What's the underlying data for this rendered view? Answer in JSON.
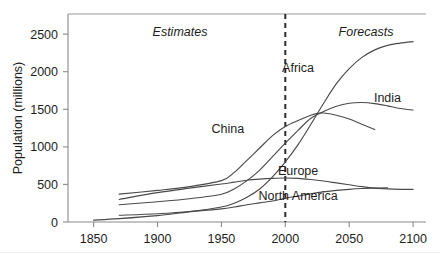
{
  "chart_data": {
    "type": "line",
    "title": "",
    "xlabel": "",
    "ylabel": "Population (millions)",
    "xlim": [
      1830,
      2110
    ],
    "ylim": [
      0,
      2700
    ],
    "grid": false,
    "legend_position": "inline-labels",
    "x_ticks": [
      "1850",
      "1900",
      "1950",
      "2000",
      "2050",
      "2100"
    ],
    "x_tick_values": [
      1850,
      1900,
      1950,
      2000,
      2050,
      2100
    ],
    "y_ticks": [
      "0",
      "500",
      "1000",
      "1500",
      "2000",
      "2500"
    ],
    "y_tick_values": [
      0,
      500,
      1000,
      1500,
      2000,
      2500
    ],
    "annotations": [
      {
        "text": "Estimates",
        "x": 1910,
        "y": 2620,
        "style": "italic"
      },
      {
        "text": "Forecasts",
        "x": 2055,
        "y": 2620,
        "style": "italic"
      },
      {
        "text": "divider",
        "x": 2000,
        "y": 0,
        "style": "dashed-vertical"
      }
    ],
    "series": [
      {
        "name": "Africa",
        "label": "Africa",
        "label_x": 2010,
        "label_y": 2000,
        "x": [
          1870,
          1900,
          1925,
          1950,
          1960,
          1970,
          1980,
          1990,
          2000,
          2010,
          2020,
          2030,
          2040,
          2050,
          2060,
          2070,
          2080,
          2090,
          2100
        ],
        "y": [
          90,
          110,
          140,
          200,
          250,
          330,
          440,
          600,
          800,
          1030,
          1300,
          1580,
          1840,
          2040,
          2190,
          2290,
          2350,
          2380,
          2400
        ]
      },
      {
        "name": "India",
        "label": "India",
        "label_x": 2080,
        "label_y": 1600,
        "x": [
          1870,
          1900,
          1925,
          1950,
          1960,
          1970,
          1980,
          1990,
          2000,
          2010,
          2020,
          2030,
          2040,
          2050,
          2060,
          2070,
          2080,
          2090,
          2100
        ],
        "y": [
          230,
          270,
          310,
          370,
          440,
          550,
          690,
          870,
          1050,
          1220,
          1380,
          1470,
          1540,
          1580,
          1590,
          1575,
          1545,
          1510,
          1490
        ]
      },
      {
        "name": "China",
        "label": "China",
        "label_x": 1955,
        "label_y": 1180,
        "x": [
          1870,
          1900,
          1925,
          1950,
          1960,
          1970,
          1980,
          1990,
          2000,
          2010,
          2020,
          2025,
          2030,
          2040,
          2050,
          2060,
          2070
        ],
        "y": [
          370,
          420,
          470,
          550,
          660,
          820,
          985,
          1150,
          1270,
          1350,
          1420,
          1445,
          1450,
          1420,
          1370,
          1300,
          1230
        ]
      },
      {
        "name": "Europe",
        "label": "Europe",
        "label_x": 2010,
        "label_y": 620,
        "x": [
          1870,
          1900,
          1925,
          1950,
          1960,
          1970,
          1980,
          1990,
          2000,
          2010,
          2020,
          2030,
          2040,
          2050,
          2060,
          2070,
          2080,
          2090,
          2100
        ],
        "y": [
          300,
          390,
          450,
          505,
          530,
          555,
          570,
          580,
          585,
          580,
          565,
          545,
          520,
          495,
          470,
          450,
          440,
          435,
          435
        ]
      },
      {
        "name": "North America",
        "label": "North America",
        "label_x": 2010,
        "label_y": 290,
        "x": [
          1850,
          1870,
          1900,
          1925,
          1950,
          1960,
          1970,
          1980,
          1990,
          2000,
          2010,
          2020,
          2030,
          2040,
          2050,
          2060,
          2070,
          2080
        ],
        "y": [
          25,
          45,
          85,
          135,
          175,
          200,
          230,
          255,
          280,
          315,
          345,
          375,
          400,
          420,
          435,
          445,
          450,
          455
        ]
      }
    ]
  }
}
